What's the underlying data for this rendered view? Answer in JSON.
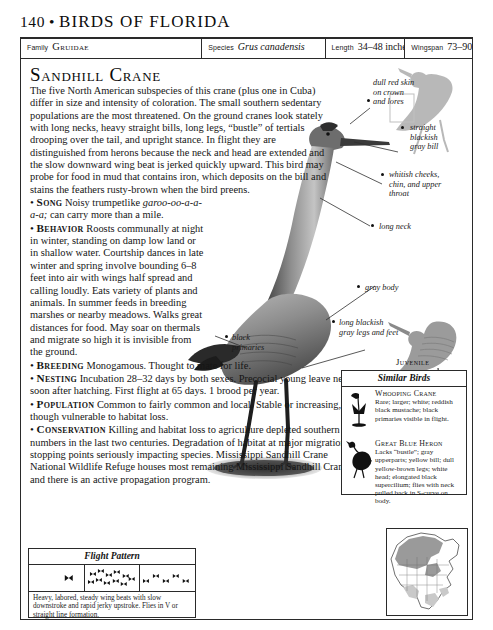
{
  "header": {
    "page_number": "140",
    "separator": "•",
    "book_title": "BIRDS OF FLORIDA"
  },
  "data_bar": {
    "family_label": "Family",
    "family_value": "Gruidae",
    "species_label": "Species",
    "species_value": "Grus canadensis",
    "length_label": "Length",
    "length_value": "34–48 inches",
    "wingspan_label": "Wingspan",
    "wingspan_value": "73–90 inches"
  },
  "species": {
    "title": "Sandhill Crane",
    "intro": "The five North American subspecies of this crane (plus one in Cuba) differ in size and intensity of coloration. The small southern sedentary populations are the most threatened. On the ground cranes look stately with long necks, heavy straight bills, long legs, “bustle” of tertials drooping over the tail, and upright stance. In flight they are distinguished from herons because the neck and head are extended and the slow downward wing beat is jerked quickly upward. This bird may probe for food in mud that contains iron, which deposits on the bill and stains the feathers rusty-brown when the bird preens."
  },
  "sections": {
    "song": {
      "heading": "Song",
      "text_before": "Noisy trumpetlike",
      "call_italic": "garoo-oo-a-a-a-a;",
      "text_after": "can carry more than a mile."
    },
    "behavior": {
      "heading": "Behavior",
      "text": "Roosts communally at night in winter, standing on damp low land or in shallow water. Courtship dances in late winter and spring involve bounding 6–8 feet into air with wings half spread and calling loudly. Eats variety of plants and animals. In summer feeds in breeding marshes or nearby meadows. Walks great distances for food. May soar on thermals and migrate so high it is invisible from the ground."
    },
    "breeding": {
      "heading": "Breeding",
      "text": "Monogamous. Thought to mate for life."
    },
    "nesting": {
      "heading": "Nesting",
      "text": "Incubation 28–32 days by both sexes. Precocial young leave nest soon after hatching. First flight at 65 days. 1 brood per year."
    },
    "population": {
      "heading": "Population",
      "text": "Common to fairly common and local. Stable or increasing, though vulnerable to habitat loss."
    },
    "conservation": {
      "heading": "Conservation",
      "text": "Killing and habitat loss to agriculture depleted southern numbers in the last two centuries. Degradation of habitat at major migration stopping points seriously impacting species. Mississippi Sandhill Crane National Wildlife Refuge houses most remaining Mississippi Sandhill Cranes, and there is an active propagation program."
    }
  },
  "callouts": {
    "crown": "dull red skin\non crown\nand lores",
    "bill": "straight\nblackish\ngray bill",
    "cheeks": "whitish cheeks,\nchin, and upper\nthroat",
    "neck": "long neck",
    "body": "gray body",
    "primaries": "black\nprimaries",
    "legs": "long blackish\ngray legs and feet"
  },
  "juvenile_label": "Juvenile",
  "similar_birds": {
    "heading": "Similar Birds",
    "entries": [
      {
        "name": "Whooping Crane",
        "description": "Rare; larger; white; reddish black mustache; black primaries visible in flight.",
        "icon": "whooping-crane-silhouette"
      },
      {
        "name": "Great Blue Heron",
        "description": "Lacks “bustle”; gray upperparts; yellow bill; dull yellow-brown legs; white head; elongated black supercilium; flies with neck pulled back in S-curve on body.",
        "icon": "great-blue-heron-silhouette"
      }
    ]
  },
  "flight_pattern": {
    "heading": "Flight Pattern",
    "caption": "Heavy, labored, steady wing beats with slow downstroke and rapid jerky upstroke. Flies in V or straight line formation.",
    "cells": [
      "single-bird-glyphs",
      "flock-cluster-glyphs",
      "line-formation-glyphs"
    ]
  },
  "range_map": {
    "name": "north-america-range-map",
    "summer_color": "#9a9a9a",
    "winter_color": "#c9c9c9"
  }
}
